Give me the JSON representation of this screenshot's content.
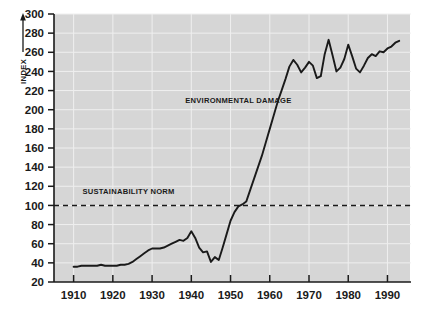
{
  "chart_data": {
    "type": "line",
    "title": "",
    "subtitle": "",
    "xlabel": "",
    "ylabel": "INDEX",
    "xlim": [
      1905,
      1996
    ],
    "ylim": [
      20,
      300
    ],
    "ytick_step": 20,
    "grid": true,
    "legend_position": "none",
    "plot_background": "#d6d6d6",
    "line_color": "#1a1a1a",
    "reference_line_color": "#1a1a1a",
    "xticks": [
      1910,
      1920,
      1930,
      1940,
      1950,
      1960,
      1970,
      1980,
      1990
    ],
    "xtick_labels": [
      "1910",
      "1920",
      "1930",
      "1940",
      "1950",
      "1960",
      "1970",
      "1980",
      "1990"
    ],
    "yticks": [
      20,
      40,
      60,
      80,
      100,
      120,
      140,
      160,
      180,
      200,
      220,
      240,
      260,
      280,
      300
    ],
    "ytick_labels": [
      "20",
      "40",
      "60",
      "80",
      "100",
      "120",
      "140",
      "160",
      "180",
      "200",
      "220",
      "240",
      "260",
      "280",
      "300"
    ],
    "annotations": [
      {
        "id": "series-label",
        "text": "ENVIRONMENTAL DAMAGE",
        "x": 1952,
        "y": 207
      },
      {
        "id": "norm-label",
        "text": "SUSTAINABILITY NORM",
        "x": 1924,
        "y": 112
      }
    ],
    "reference_lines": [
      {
        "id": "sustainability-norm",
        "label": "SUSTAINABILITY NORM",
        "value": 100,
        "orientation": "horizontal",
        "style": "dashed"
      }
    ],
    "series": [
      {
        "name": "ENVIRONMENTAL DAMAGE",
        "x": [
          1910,
          1911,
          1912,
          1913,
          1914,
          1915,
          1916,
          1917,
          1918,
          1919,
          1920,
          1921,
          1922,
          1923,
          1924,
          1925,
          1926,
          1927,
          1928,
          1929,
          1930,
          1931,
          1932,
          1933,
          1934,
          1935,
          1936,
          1937,
          1938,
          1939,
          1940,
          1941,
          1942,
          1943,
          1944,
          1945,
          1946,
          1947,
          1948,
          1949,
          1950,
          1951,
          1952,
          1953,
          1954,
          1955,
          1956,
          1957,
          1958,
          1959,
          1960,
          1961,
          1962,
          1963,
          1964,
          1965,
          1966,
          1967,
          1968,
          1969,
          1970,
          1971,
          1972,
          1973,
          1974,
          1975,
          1976,
          1977,
          1978,
          1979,
          1980,
          1981,
          1982,
          1983,
          1984,
          1985,
          1986,
          1987,
          1988,
          1989,
          1990,
          1991,
          1992,
          1993
        ],
        "values": [
          36,
          36,
          37,
          37,
          37,
          37,
          37,
          38,
          37,
          37,
          37,
          37,
          38,
          38,
          39,
          41,
          44,
          47,
          50,
          53,
          55,
          55,
          55,
          56,
          58,
          60,
          62,
          64,
          63,
          66,
          73,
          66,
          56,
          51,
          52,
          41,
          46,
          43,
          56,
          70,
          84,
          93,
          99,
          101,
          104,
          116,
          128,
          140,
          152,
          166,
          180,
          194,
          208,
          220,
          232,
          245,
          252,
          247,
          239,
          244,
          250,
          246,
          233,
          235,
          258,
          273,
          257,
          240,
          244,
          253,
          268,
          256,
          243,
          239,
          246,
          254,
          258,
          256,
          261,
          260,
          264,
          266,
          270,
          272
        ]
      }
    ]
  },
  "axis": {
    "y_title": "INDEX",
    "arrow_icon": "up-arrow-icon"
  }
}
